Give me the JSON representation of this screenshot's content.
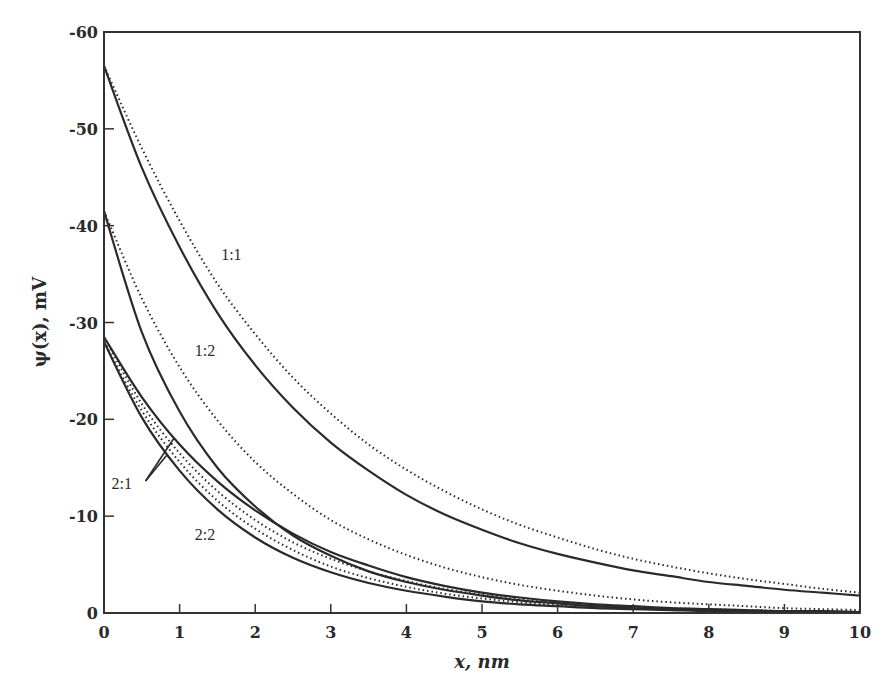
{
  "chart_data": {
    "type": "line",
    "title": "",
    "xlabel": "x, nm",
    "ylabel": "ψ(x), mV",
    "xlim": [
      0,
      10
    ],
    "ylim": [
      0,
      -60
    ],
    "xticks": [
      0,
      1,
      2,
      3,
      4,
      5,
      6,
      7,
      8,
      9,
      10
    ],
    "yticks": [
      0,
      -10,
      -20,
      -30,
      -40,
      -50,
      -60
    ],
    "grid": false,
    "legend": "none (inline labels)",
    "annotations": [
      {
        "text": "1:1",
        "x": 1.55,
        "y": -36.5
      },
      {
        "text": "1:2",
        "x": 1.2,
        "y": -26.5
      },
      {
        "text": "2:1",
        "x": 0.1,
        "y": -12.8,
        "pointers": [
          [
            0.92,
            -18.0
          ],
          [
            0.83,
            -16.3
          ]
        ]
      },
      {
        "text": "2:2",
        "x": 1.2,
        "y": -7.5
      }
    ],
    "x": [
      0,
      0.5,
      1,
      1.5,
      2,
      2.5,
      3,
      3.5,
      4,
      4.5,
      5,
      5.5,
      6,
      6.5,
      7,
      7.5,
      8,
      8.5,
      9,
      9.5,
      10
    ],
    "series": [
      {
        "name": "1:1 solid",
        "style": "solid",
        "values": [
          -56.5,
          -46.0,
          -37.8,
          -31.0,
          -25.6,
          -21.2,
          -17.6,
          -14.7,
          -12.2,
          -10.2,
          -8.6,
          -7.2,
          -6.1,
          -5.2,
          -4.4,
          -3.8,
          -3.2,
          -2.8,
          -2.4,
          -2.1,
          -1.8
        ]
      },
      {
        "name": "1:1 dotted",
        "style": "dotted",
        "values": [
          -56.5,
          -48.0,
          -40.5,
          -34.0,
          -28.8,
          -24.3,
          -20.6,
          -17.4,
          -14.8,
          -12.6,
          -10.7,
          -9.1,
          -7.8,
          -6.6,
          -5.6,
          -4.8,
          -4.1,
          -3.5,
          -3.0,
          -2.5,
          -2.1
        ]
      },
      {
        "name": "1:2 solid",
        "style": "solid",
        "values": [
          -41.5,
          -29.0,
          -20.8,
          -15.0,
          -11.0,
          -8.0,
          -5.9,
          -4.3,
          -3.2,
          -2.4,
          -1.8,
          -1.3,
          -1.0,
          -0.7,
          -0.5,
          -0.4,
          -0.3,
          -0.2,
          -0.2,
          -0.1,
          -0.1
        ]
      },
      {
        "name": "1:2 dotted",
        "style": "dotted",
        "values": [
          -41.5,
          -32.5,
          -25.4,
          -19.9,
          -15.6,
          -12.3,
          -9.6,
          -7.6,
          -6.0,
          -4.7,
          -3.7,
          -2.9,
          -2.3,
          -1.8,
          -1.4,
          -1.1,
          -0.9,
          -0.7,
          -0.5,
          -0.4,
          -0.3
        ]
      },
      {
        "name": "2:1 solid",
        "style": "solid",
        "values": [
          -28.5,
          -22.3,
          -17.4,
          -13.6,
          -10.6,
          -8.2,
          -6.3,
          -4.9,
          -3.7,
          -2.8,
          -2.1,
          -1.6,
          -1.2,
          -0.9,
          -0.7,
          -0.5,
          -0.4,
          -0.3,
          -0.2,
          -0.2,
          -0.1
        ]
      },
      {
        "name": "2:1 dotted",
        "style": "dotted",
        "values": [
          -28.5,
          -21.6,
          -16.5,
          -12.6,
          -9.6,
          -7.3,
          -5.6,
          -4.3,
          -3.3,
          -2.5,
          -1.9,
          -1.4,
          -1.1,
          -0.8,
          -0.6,
          -0.5,
          -0.4,
          -0.3,
          -0.2,
          -0.2,
          -0.1
        ]
      },
      {
        "name": "2:2 solid",
        "style": "solid",
        "values": [
          -28.0,
          -20.2,
          -14.7,
          -10.7,
          -7.8,
          -5.7,
          -4.2,
          -3.1,
          -2.3,
          -1.7,
          -1.2,
          -0.9,
          -0.7,
          -0.5,
          -0.4,
          -0.3,
          -0.2,
          -0.2,
          -0.1,
          -0.1,
          -0.1
        ]
      },
      {
        "name": "2:2 dotted",
        "style": "dotted",
        "values": [
          -28.0,
          -20.9,
          -15.6,
          -11.6,
          -8.7,
          -6.5,
          -4.8,
          -3.6,
          -2.7,
          -2.0,
          -1.5,
          -1.1,
          -0.8,
          -0.6,
          -0.5,
          -0.4,
          -0.3,
          -0.2,
          -0.2,
          -0.1,
          -0.1
        ]
      }
    ]
  }
}
